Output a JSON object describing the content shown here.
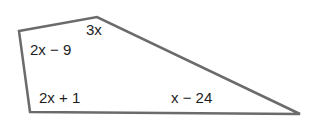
{
  "diagram": {
    "type": "quadrilateral",
    "stroke_color": "#6b6b6b",
    "text_color": "#1e1e1e",
    "angle_labels": {
      "top": "3x",
      "top_left": "2x − 9",
      "bottom_left": "2x + 1",
      "bottom_right": "x − 24"
    }
  }
}
